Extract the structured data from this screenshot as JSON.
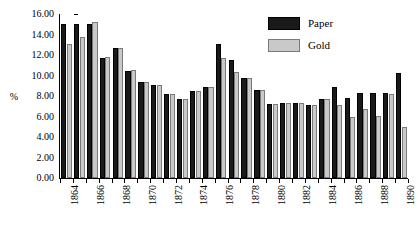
{
  "chart_data": {
    "type": "bar",
    "title": "",
    "xlabel": "",
    "ylabel": "%",
    "ylim": [
      0,
      16
    ],
    "ytick_step": 2,
    "grid": false,
    "legend_position": "top-right",
    "categories": [
      "1864",
      "1865",
      "1866",
      "1867",
      "1868",
      "1869",
      "1870",
      "1871",
      "1872",
      "1873",
      "1874",
      "1875",
      "1876",
      "1877",
      "1878",
      "1879",
      "1880",
      "1881",
      "1882",
      "1883",
      "1884",
      "1885",
      "1886",
      "1887",
      "1888",
      "1889",
      "1890"
    ],
    "xtick_labels": [
      "1864",
      "1866",
      "1868",
      "1870",
      "1872",
      "1874",
      "1876",
      "1878",
      "1880",
      "1882",
      "1884",
      "1886",
      "1888",
      "1890"
    ],
    "ytick_labels": [
      "16.00",
      "14.00",
      "12.00",
      "10.00",
      "8.00",
      "6.00",
      "4.00",
      "2.00",
      "0.00"
    ],
    "series": [
      {
        "name": "Paper",
        "color": "#1a1a1a",
        "values": [
          15.0,
          15.0,
          15.0,
          11.75,
          12.65,
          10.45,
          9.4,
          9.05,
          8.15,
          7.75,
          8.45,
          8.85,
          13.05,
          11.55,
          9.75,
          8.55,
          7.25,
          7.3,
          7.35,
          7.1,
          7.75,
          8.85,
          7.85,
          8.25,
          8.25,
          8.25,
          10.25
        ]
      },
      {
        "name": "Gold",
        "color": "#c9c9c9",
        "values": [
          13.1,
          13.8,
          15.2,
          11.8,
          12.7,
          10.5,
          9.4,
          9.05,
          8.15,
          7.75,
          8.45,
          8.85,
          11.7,
          10.35,
          9.75,
          8.55,
          7.25,
          7.3,
          7.35,
          7.1,
          7.75,
          7.1,
          6.0,
          6.75,
          6.05,
          8.2,
          4.95
        ]
      }
    ]
  },
  "legend": {
    "entries": [
      {
        "label": "Paper",
        "swatch": "paper-swatch"
      },
      {
        "label": "Gold",
        "swatch": "gold-swatch"
      }
    ]
  },
  "axes": {
    "y_axis_title": "%"
  }
}
